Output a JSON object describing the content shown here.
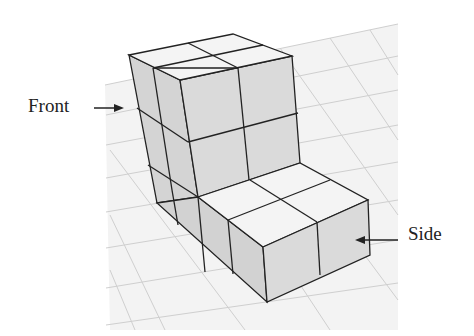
{
  "figure": {
    "labels": {
      "front": "Front",
      "side": "Side"
    },
    "colors": {
      "top_face": "#f2f2f2",
      "left_face": "#d6d6d6",
      "right_face": "#dcdcdc",
      "edge": "#222222",
      "grid": "#d0d0d0"
    },
    "structure": {
      "upper_block": "2 wide x 2 deep x 3 high (back columns)",
      "lower_block": "2 wide x 2 deep x 1 high (front step)"
    }
  }
}
